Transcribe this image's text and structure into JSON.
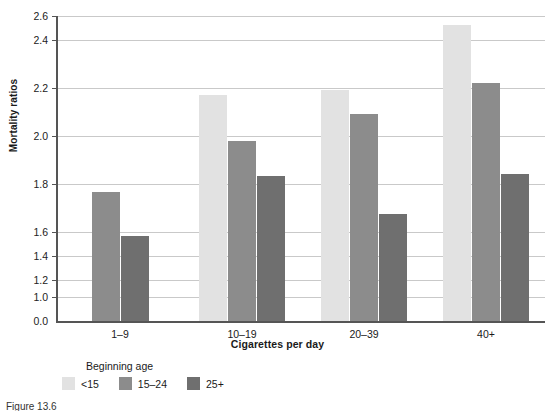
{
  "chart_data": {
    "type": "bar",
    "title": "",
    "xlabel": "Cigarettes per day",
    "ylabel": "Mortality ratios",
    "categories": [
      "1–9",
      "10–19",
      "20–39",
      "40+"
    ],
    "series": [
      {
        "name": "<15",
        "color": "#e2e2e2",
        "values": [
          null,
          2.15,
          2.18,
          2.55
        ]
      },
      {
        "name": "15–24",
        "color": "#8c8c8c",
        "values": [
          1.6,
          1.89,
          2.04,
          2.22
        ]
      },
      {
        "name": "25+",
        "color": "#6f6f6f",
        "values": [
          1.35,
          1.69,
          1.47,
          1.7
        ]
      }
    ],
    "ylim": [
      0.0,
      2.6
    ],
    "y_ticks": [
      "0.0",
      "1.0",
      "1.2",
      "1.4",
      "1.6",
      "1.8",
      "2.0",
      "2.2",
      "2.4",
      "2.6"
    ],
    "y_axis_note": "broken axis: baseline 0.0 then jumps to 1.0",
    "grid": true,
    "legend_title": "Beginning age",
    "legend_position": "below-left"
  },
  "caption": {
    "text": "Figure  13.6"
  }
}
